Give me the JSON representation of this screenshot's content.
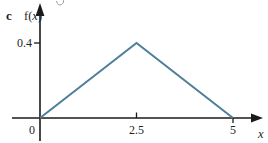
{
  "figure": {
    "panel_label": "c",
    "y_axis_label": {
      "pre": "f(",
      "var": "x",
      "post": ")"
    },
    "x_axis_label": "x",
    "origin_label": "0"
  },
  "colors": {
    "line": "#4e7f9a",
    "axis": "#1a1a1a",
    "stray_mark": "#9a9a9a"
  },
  "chart_data": {
    "type": "line",
    "title": "",
    "xlabel": "x",
    "ylabel": "f(x)",
    "points": [
      [
        0,
        0
      ],
      [
        2.5,
        0.4
      ],
      [
        5,
        0
      ]
    ],
    "xlim": [
      0,
      5.4
    ],
    "ylim": [
      0,
      0.55
    ],
    "grid": false,
    "legend": "none",
    "xticks": [
      {
        "value": 2.5,
        "label": "2.5",
        "side": "above"
      },
      {
        "value": 5,
        "label": "5",
        "side": "below"
      }
    ],
    "yticks": [
      {
        "value": 0.4,
        "label": "0.4"
      }
    ]
  }
}
